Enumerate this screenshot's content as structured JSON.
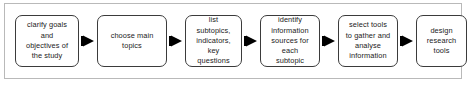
{
  "diagram": {
    "frame_border_color": "#b9b9b9",
    "node_border_color": "#3b3b3b",
    "node_fill_color": "#ffffff",
    "arrow_color": "#000000",
    "text_color": "#1b1b1b",
    "arrow_icon_name": "arrow-right-triangle-icon",
    "steps": [
      {
        "id": "step-1",
        "label": "clarify goals\nand\nobjectives of\nthe study"
      },
      {
        "id": "step-2",
        "label": "choose main\ntopics"
      },
      {
        "id": "step-3",
        "label": "list\nsubtopics,\nindicators,\nkey\nquestions"
      },
      {
        "id": "step-4",
        "label": "identify\ninformation\nsources for\neach\nsubtopic"
      },
      {
        "id": "step-5",
        "label": "select tools\nto gather and\nanalyse\ninformation"
      },
      {
        "id": "step-6",
        "label": "design\nresearch\ntools"
      }
    ],
    "connectors": [
      {
        "id": "arrow-1",
        "from": "step-1",
        "to": "step-2",
        "direction": "right"
      },
      {
        "id": "arrow-2",
        "from": "step-2",
        "to": "step-3",
        "direction": "right"
      },
      {
        "id": "arrow-3",
        "from": "step-3",
        "to": "step-4",
        "direction": "right"
      },
      {
        "id": "arrow-4",
        "from": "step-4",
        "to": "step-5",
        "direction": "right"
      },
      {
        "id": "arrow-5",
        "from": "step-5",
        "to": "step-6",
        "direction": "right"
      }
    ]
  }
}
